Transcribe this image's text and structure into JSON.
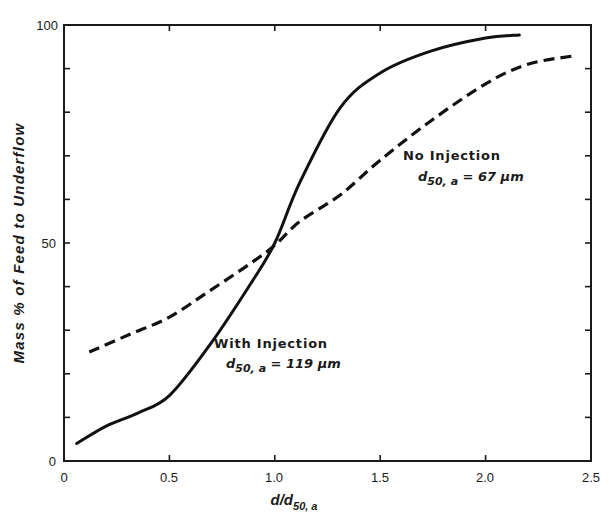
{
  "chart_data": {
    "type": "line",
    "title": "",
    "xlabel": "d/d50,a",
    "ylabel": "Mass % of Feed to Underflow",
    "xlim": [
      0,
      2.5
    ],
    "ylim": [
      0,
      100
    ],
    "x_ticks": [
      "0",
      "0.5",
      "1.0",
      "1.5",
      "2.0",
      "2.5"
    ],
    "y_ticks": [
      "0",
      "50",
      "100"
    ],
    "grid": false,
    "legend": "none (inline annotations)",
    "series": [
      {
        "name": "With Injection",
        "annotation": "d50,a = 119 µm",
        "style": "solid",
        "x": [
          0.06,
          0.2,
          0.35,
          0.5,
          0.69,
          0.89,
          1.0,
          1.12,
          1.31,
          1.5,
          1.74,
          2.0,
          2.16
        ],
        "y": [
          4,
          8,
          11,
          15,
          26.5,
          41,
          50,
          64,
          81,
          89,
          94,
          97,
          97.7
        ]
      },
      {
        "name": "No Injection",
        "annotation": "d50,a = 67 µm",
        "style": "dashed",
        "x": [
          0.12,
          0.31,
          0.5,
          0.69,
          0.89,
          1.0,
          1.12,
          1.31,
          1.5,
          1.74,
          2.0,
          2.2,
          2.43
        ],
        "y": [
          25,
          29,
          33,
          39,
          45.5,
          49.5,
          55,
          61,
          69,
          78,
          86.5,
          91,
          93
        ]
      }
    ]
  },
  "labels": {
    "ylabel": "Mass % of Feed to Underflow",
    "xlabel_main": "d/d",
    "xlabel_sub": "50, a",
    "no_injection_title": "No Injection",
    "no_injection_d": "d",
    "no_injection_sub": "50, a",
    "no_injection_val": " = 67 µm",
    "with_injection_title": "With Injection",
    "with_injection_d": "d",
    "with_injection_sub": "50, a",
    "with_injection_val": " = 119 µm",
    "xtick_0": "0",
    "xtick_1": "0.5",
    "xtick_2": "1.0",
    "xtick_3": "1.5",
    "xtick_4": "2.0",
    "xtick_5": "2.5",
    "ytick_0": "0",
    "ytick_50": "50",
    "ytick_100": "100"
  }
}
